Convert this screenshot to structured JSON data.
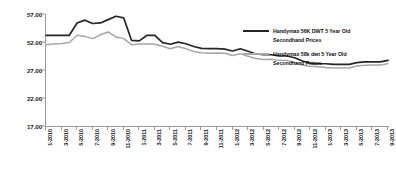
{
  "chart_data": {
    "type": "line",
    "title": "",
    "subtitle": "",
    "xlabel": "",
    "ylabel": "",
    "ylim": [
      17.0,
      57.0
    ],
    "yticks": [
      17.0,
      22.0,
      27.0,
      52.0,
      57.0
    ],
    "ytick_labels": [
      "17.00",
      "22.00",
      "27.00",
      "52.00",
      "57.00"
    ],
    "grid": false,
    "legend_position": "top-right",
    "x": [
      "1-2010",
      "2-2010",
      "3-2010",
      "4-2010",
      "5-2010",
      "6-2010",
      "7-2010",
      "8-2010",
      "9-2010",
      "10-2010",
      "11-2010",
      "12-2010",
      "1-2011",
      "2-2011",
      "3-2011",
      "4-2011",
      "5-2011",
      "6-2011",
      "7-2011",
      "8-2011",
      "9-2011",
      "10-2011",
      "11-2011",
      "12-2011",
      "1-2012",
      "2-2012",
      "3-2012",
      "4-2012",
      "5-2012",
      "6-2012",
      "7-2012",
      "8-2012",
      "9-2012",
      "10-2012",
      "11-2012",
      "12-2012",
      "1-2013",
      "2-2013",
      "3-2013",
      "4-2013",
      "5-2013",
      "6-2013",
      "7-2013",
      "8-2013",
      "9-2013"
    ],
    "xtick_labels": [
      "1-2010",
      "3-2010",
      "5-2010",
      "7-2010",
      "9-2010",
      "11-2010",
      "1-2011",
      "3-2011",
      "5-2011",
      "7-2011",
      "9-2011",
      "11-2011",
      "1-2012",
      "3-2012",
      "5-2012",
      "7-2012",
      "9-2012",
      "11-2012",
      "1-2013",
      "3-2013",
      "5-2013",
      "7-2013",
      "9-2013"
    ],
    "series": [
      {
        "name": "Handymax 56K DWT 5 Year Old Secondhand Prices",
        "color": "#262626",
        "values": [
          53.2,
          53.2,
          53.2,
          53.2,
          55.4,
          55.9,
          55.3,
          55.4,
          56.0,
          56.6,
          56.3,
          52.3,
          52.2,
          53.2,
          53.2,
          51.4,
          50.0,
          51.9,
          50.4,
          48.0,
          46.3,
          46.0,
          46.0,
          45.6,
          44.0,
          46.0,
          43.7,
          41.3,
          40.6,
          40.6,
          39.5,
          39.5,
          37.9,
          35.0,
          33.0,
          32.6,
          32.6,
          32.0,
          32.0,
          32.0,
          33.6,
          34.3,
          34.3,
          34.2,
          35.6
        ]
      },
      {
        "name": "Handymax 58k dwt 5 Year Old Secondhand Prices",
        "color": "#a6a6a6",
        "values": [
          49.6,
          50.2,
          50.6,
          51.5,
          53.2,
          53.0,
          52.6,
          53.3,
          53.8,
          52.9,
          52.6,
          49.6,
          50.3,
          50.3,
          50.0,
          48.2,
          46.0,
          48.0,
          46.0,
          43.6,
          42.3,
          41.9,
          42.2,
          42.0,
          40.0,
          41.6,
          39.2,
          37.2,
          36.3,
          36.6,
          35.6,
          35.4,
          33.6,
          31.3,
          30.3,
          30.0,
          29.3,
          28.8,
          28.8,
          28.8,
          30.6,
          31.3,
          31.5,
          31.4,
          32.7
        ]
      }
    ]
  },
  "legend": {
    "items": [
      {
        "line1": "Handymax 56K DWT 5 Year Old",
        "line2": "Secondhand Prices"
      },
      {
        "line1": "Handymax 58k dwt 5 Year Old",
        "line2": "Secondhand Prices"
      }
    ]
  },
  "colors": {
    "series_dark": "#262626",
    "series_light": "#a6a6a6",
    "axis": "#9a9a9a",
    "text": "#111111",
    "background": "#ffffff"
  }
}
